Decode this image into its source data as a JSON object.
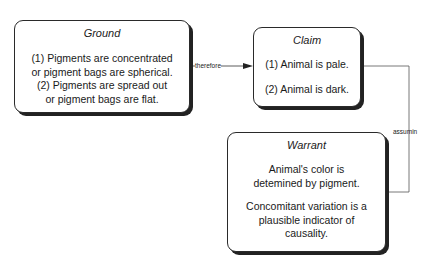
{
  "diagram": {
    "type": "toulmin-argument",
    "nodes": {
      "ground": {
        "title": "Ground",
        "lines": [
          "(1) Pigments are concentrated",
          "or pigment bags are spherical.",
          "(2) Pigments are spread out",
          "or pigment bags are flat."
        ]
      },
      "claim": {
        "title": "Claim",
        "items": [
          "(1) Animal is pale.",
          "(2) Animal is dark."
        ]
      },
      "warrant": {
        "title": "Warrant",
        "paragraphs": [
          [
            "Animal's color is",
            "detemined by pigment."
          ],
          [
            "Concomitant variation is a",
            "plausible indicator of",
            "causality."
          ]
        ]
      }
    },
    "edges": [
      {
        "from": "ground",
        "to": "claim",
        "label": "therefore",
        "arrow": true
      },
      {
        "from": "claim",
        "to": "warrant",
        "label": "assumin",
        "arrow": false
      }
    ]
  }
}
